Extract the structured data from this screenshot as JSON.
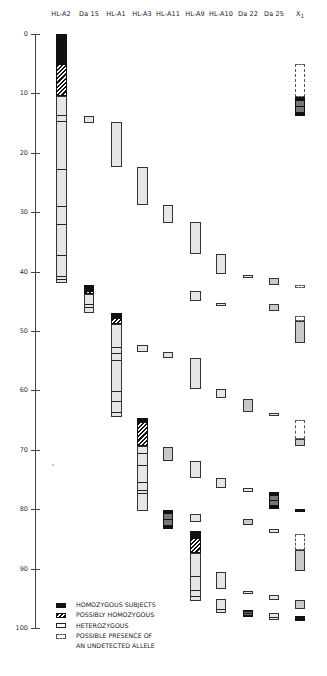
{
  "chart_data": {
    "type": "table",
    "title": "",
    "ylabel": "",
    "ylim": [
      0,
      100
    ],
    "y_ticks": [
      0,
      10,
      20,
      30,
      40,
      50,
      60,
      70,
      80,
      90,
      100
    ],
    "columns": [
      "HL-A2",
      "Da 15",
      "HL-A1",
      "HL-A3",
      "HL-A11",
      "HL-A9",
      "HL-A10",
      "Da 22",
      "Da 25",
      "X1"
    ],
    "legend": [
      {
        "key": "homozygous",
        "label": "HOMOZYGOUS SUBJECTS"
      },
      {
        "key": "possibly_homozygous",
        "label": "POSSIBLY HOMOZYGOUS"
      },
      {
        "key": "heterozygous",
        "label": "HETEROZYGOUS"
      },
      {
        "key": "undetected",
        "label": "POSSIBLE PRESENCE OF"
      },
      {
        "key": "undetected_cont",
        "label": "AN UNDETECTED ALLELE"
      }
    ],
    "bars": [
      {
        "column": "HL-A2",
        "segments": [
          {
            "from": 0,
            "to": 5,
            "type": "homozygous"
          },
          {
            "from": 5,
            "to": 10.5,
            "type": "possibly_homozygous"
          },
          {
            "from": 10.5,
            "to": 42,
            "type": "heterozygous",
            "dividers": [
              13.5,
              14.5,
              22.5,
              28.8,
              31.8,
              37,
              40.5,
              41
            ]
          }
        ]
      },
      {
        "column": "Da 15",
        "segments": [
          {
            "from": 13.8,
            "to": 15,
            "type": "heterozygous"
          },
          {
            "from": 42.3,
            "to": 43.2,
            "type": "homozygous"
          },
          {
            "from": 43.2,
            "to": 43.8,
            "type": "possibly_homozygous"
          },
          {
            "from": 43.8,
            "to": 47,
            "type": "heterozygous",
            "dividers": [
              45.3,
              45.8
            ]
          }
        ]
      },
      {
        "column": "HL-A1",
        "segments": [
          {
            "from": 14.8,
            "to": 22.4,
            "type": "heterozygous"
          },
          {
            "from": 47,
            "to": 47.8,
            "type": "homozygous"
          },
          {
            "from": 47.8,
            "to": 48.8,
            "type": "possibly_homozygous"
          },
          {
            "from": 48.8,
            "to": 64.5,
            "type": "heterozygous",
            "dividers": [
              52.5,
              53.5,
              54.8,
              60,
              61.6,
              63.5
            ]
          }
        ]
      },
      {
        "column": "HL-A3",
        "segments": [
          {
            "from": 22.4,
            "to": 28.8,
            "type": "heterozygous"
          },
          {
            "from": 52.4,
            "to": 53.5,
            "type": "heterozygous"
          },
          {
            "from": 64.6,
            "to": 65.3,
            "type": "homozygous"
          },
          {
            "from": 65.3,
            "to": 69.3,
            "type": "possibly_homozygous"
          },
          {
            "from": 69.3,
            "to": 80.3,
            "type": "heterozygous",
            "dividers": [
              70.4,
              72.4,
              75.2,
              76.6,
              77.1
            ]
          }
        ]
      },
      {
        "column": "HL-A11",
        "segments": [
          {
            "from": 28.8,
            "to": 31.8,
            "type": "heterozygous"
          },
          {
            "from": 53.5,
            "to": 54.6,
            "type": "heterozygous"
          },
          {
            "from": 69.5,
            "to": 71.9,
            "type": "heterozygous_dark"
          },
          {
            "from": 80.2,
            "to": 83.4,
            "type": "homozygous_mixed"
          }
        ]
      },
      {
        "column": "HL-A9",
        "segments": [
          {
            "from": 31.7,
            "to": 37,
            "type": "heterozygous"
          },
          {
            "from": 43.2,
            "to": 44.9,
            "type": "heterozygous"
          },
          {
            "from": 54.6,
            "to": 59.8,
            "type": "heterozygous"
          },
          {
            "from": 71.9,
            "to": 74.8,
            "type": "heterozygous"
          },
          {
            "from": 80.8,
            "to": 82.1,
            "type": "heterozygous"
          },
          {
            "from": 83.6,
            "to": 84.8,
            "type": "homozygous"
          },
          {
            "from": 84.8,
            "to": 87.3,
            "type": "possibly_homozygous"
          },
          {
            "from": 87.3,
            "to": 95.5,
            "type": "heterozygous",
            "dividers": [
              91,
              93.5,
              94.5
            ]
          }
        ]
      },
      {
        "column": "HL-A10",
        "segments": [
          {
            "from": 37,
            "to": 40.4,
            "type": "heterozygous"
          },
          {
            "from": 45.3,
            "to": 45.8,
            "type": "heterozygous"
          },
          {
            "from": 59.8,
            "to": 61.3,
            "type": "heterozygous"
          },
          {
            "from": 74.8,
            "to": 76.4,
            "type": "heterozygous"
          },
          {
            "from": 90.5,
            "to": 93.4,
            "type": "heterozygous"
          },
          {
            "from": 95.2,
            "to": 97.5,
            "type": "heterozygous",
            "dividers": [
              96.7
            ]
          }
        ]
      },
      {
        "column": "Da 22",
        "segments": [
          {
            "from": 40.5,
            "to": 41,
            "type": "heterozygous"
          },
          {
            "from": 61.4,
            "to": 63.6,
            "type": "heterozygous_dark"
          },
          {
            "from": 76.5,
            "to": 77.1,
            "type": "heterozygous"
          },
          {
            "from": 81.7,
            "to": 82.7,
            "type": "heterozygous_dark"
          },
          {
            "from": 93.7,
            "to": 94.1,
            "type": "heterozygous"
          },
          {
            "from": 97,
            "to": 98.2,
            "type": "homozygous_mixed"
          }
        ]
      },
      {
        "column": "Da 25",
        "segments": [
          {
            "from": 41,
            "to": 42.2,
            "type": "heterozygous_dark"
          },
          {
            "from": 45.5,
            "to": 46.6,
            "type": "heterozygous_dark"
          },
          {
            "from": 63.8,
            "to": 64.3,
            "type": "heterozygous"
          },
          {
            "from": 77.1,
            "to": 79.9,
            "type": "homozygous_mixed"
          },
          {
            "from": 83.4,
            "to": 84,
            "type": "heterozygous"
          },
          {
            "from": 94.4,
            "to": 95.3,
            "type": "heterozygous"
          },
          {
            "from": 97.5,
            "to": 98.6,
            "type": "heterozygous",
            "dividers": [
              98
            ]
          }
        ]
      },
      {
        "column": "X1",
        "segments": [
          {
            "from": 5,
            "to": 10.6,
            "type": "undetected"
          },
          {
            "from": 10.6,
            "to": 13.8,
            "type": "homozygous_mixed"
          },
          {
            "from": 42.2,
            "to": 42.7,
            "type": "undetected"
          },
          {
            "from": 47.4,
            "to": 48.4,
            "type": "undetected"
          },
          {
            "from": 48.4,
            "to": 52,
            "type": "heterozygous_dark"
          },
          {
            "from": 65,
            "to": 68.1,
            "type": "undetected"
          },
          {
            "from": 68.1,
            "to": 69.3,
            "type": "heterozygous_dark"
          },
          {
            "from": 79.9,
            "to": 80.5,
            "type": "homozygous"
          },
          {
            "from": 84.1,
            "to": 86.9,
            "type": "undetected"
          },
          {
            "from": 86.9,
            "to": 90.4,
            "type": "heterozygous_dark"
          },
          {
            "from": 95.3,
            "to": 96.8,
            "type": "heterozygous_dark"
          },
          {
            "from": 97.9,
            "to": 98.8,
            "type": "homozygous_mixed"
          }
        ]
      }
    ]
  },
  "header": {
    "labels": [
      "HL-A2",
      "Da 15",
      "HL-A1",
      "HL-A3",
      "HL-A11",
      "HL-A9",
      "HL-A10",
      "Da 22",
      "Da 25",
      "X"
    ],
    "x1_sub": "1"
  },
  "axis": {
    "ticks": [
      "0",
      "10",
      "20",
      "30",
      "40",
      "50",
      "60",
      "70",
      "80",
      "90",
      "100"
    ]
  },
  "legend": {
    "homozygous": "HOMOZYGOUS SUBJECTS",
    "possibly": "POSSIBLY HOMOZYGOUS",
    "heterozygous": "HETEROZYGOUS",
    "undetected_1": "POSSIBLE PRESENCE OF",
    "undetected_2": "AN UNDETECTED ALLELE"
  },
  "colors": {
    "homozygous": "#111111",
    "heterozygous": "#e4e4e4",
    "heterozygous_dark": "#c9c9c9",
    "border": "#333333"
  }
}
